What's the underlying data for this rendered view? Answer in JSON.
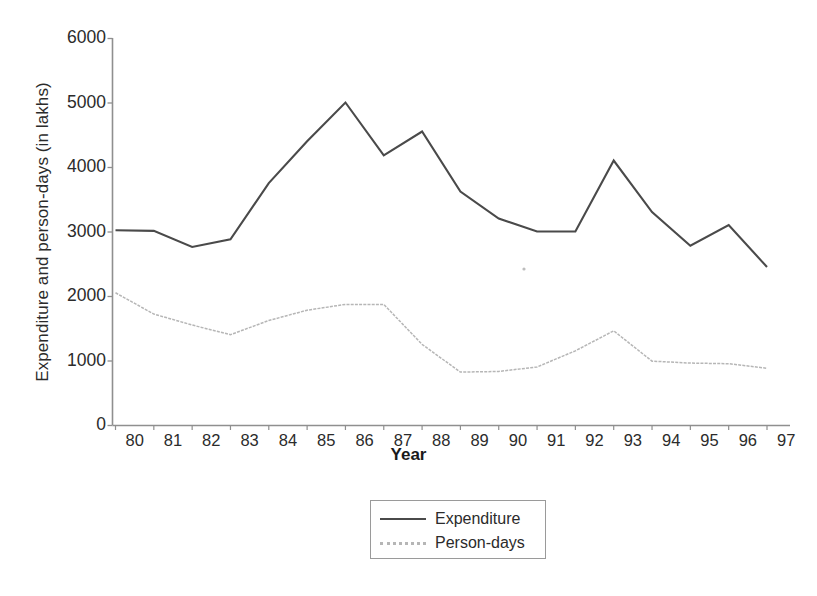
{
  "chart_data": {
    "type": "line",
    "title": "",
    "xlabel": "Year",
    "ylabel": "Expenditure and person-days (in lakhs)",
    "categories": [
      "80",
      "81",
      "82",
      "83",
      "84",
      "85",
      "86",
      "87",
      "88",
      "89",
      "90",
      "91",
      "92",
      "93",
      "94",
      "95",
      "96",
      "97"
    ],
    "x": [
      1980,
      1981,
      1982,
      1983,
      1984,
      1985,
      1986,
      1987,
      1988,
      1989,
      1990,
      1991,
      1992,
      1993,
      1994,
      1995,
      1996,
      1997
    ],
    "xlim": [
      1980,
      1997
    ],
    "ylim": [
      0,
      6000
    ],
    "yticks": [
      0,
      1000,
      2000,
      3000,
      4000,
      5000,
      6000
    ],
    "ytick_labels": [
      "0",
      "1000",
      "2000",
      "3000",
      "4000",
      "5000",
      "6000"
    ],
    "grid": false,
    "legend_position": "bottom-center",
    "series": [
      {
        "name": "Expenditure",
        "color": "#4a4a4a",
        "style": "solid",
        "values": [
          3020,
          3010,
          2760,
          2880,
          3750,
          4400,
          5000,
          4180,
          4550,
          3620,
          3200,
          3000,
          3000,
          4100,
          3300,
          2780,
          3100,
          2450
        ]
      },
      {
        "name": "Person-days",
        "color": "#b6b6b6",
        "style": "dotted",
        "values": [
          2050,
          1720,
          1550,
          1400,
          1620,
          1780,
          1870,
          1870,
          1250,
          820,
          830,
          900,
          1150,
          1460,
          990,
          960,
          950,
          880
        ]
      }
    ]
  },
  "axes": {
    "y_title": "Expenditure and person-days (in lakhs)",
    "x_title": "Year",
    "y_labels": [
      "6000",
      "5000",
      "4000",
      "3000",
      "2000",
      "1000",
      "0"
    ],
    "x_labels": [
      "80",
      "81",
      "82",
      "83",
      "84",
      "85",
      "86",
      "87",
      "88",
      "89",
      "90",
      "91",
      "92",
      "93",
      "94",
      "95",
      "96",
      "97"
    ]
  },
  "legend": {
    "items": [
      {
        "label": "Expenditure",
        "swatch": "solid-line-swatch"
      },
      {
        "label": "Person-days",
        "swatch": "dotted-line-swatch"
      }
    ]
  },
  "colors": {
    "expenditure_line": "#4a4a4a",
    "persondays_line": "#b6b6b6",
    "axis": "#8f8f8f",
    "text": "#2b2b2b",
    "background": "#ffffff"
  }
}
